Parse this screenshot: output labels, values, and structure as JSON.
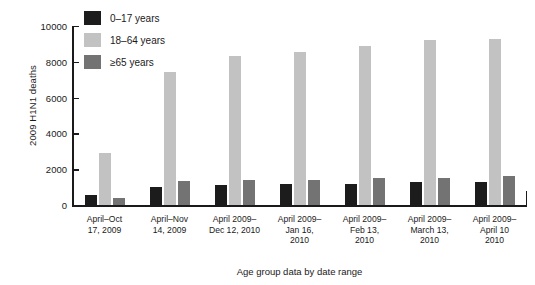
{
  "chart_data": {
    "type": "bar",
    "title": "",
    "xlabel": "Age group data by date range",
    "ylabel": "2009 H1N1 deaths",
    "ylim": [
      0,
      10000
    ],
    "yticks": [
      0,
      2000,
      4000,
      6000,
      8000,
      10000
    ],
    "ytick_labels": [
      "0",
      "2000",
      "4000",
      "6000",
      "8000",
      "10000"
    ],
    "grid": false,
    "legend_position": "top-left-inside",
    "categories": [
      "April–Oct\n17, 2009",
      "April–Nov\n14, 2009",
      "April 2009–\nDec 12, 2010",
      "April 2009–\nJan 16,\n2010",
      "April 2009–\nFeb 13,\n2010",
      "April 2009–\nMarch 13,\n2010",
      "April 2009–\nApril 10\n2010"
    ],
    "series": [
      {
        "name": "0–17 years",
        "color": "#1c1c1c",
        "values": [
          540,
          1020,
          1130,
          1180,
          1190,
          1280,
          1300
        ]
      },
      {
        "name": "18–64 years",
        "color": "#c2c2c2",
        "values": [
          2900,
          7430,
          8340,
          8570,
          8900,
          9200,
          9260
        ]
      },
      {
        "name": "≥65 years",
        "color": "#737373",
        "values": [
          400,
          1320,
          1380,
          1400,
          1500,
          1530,
          1620
        ]
      }
    ]
  },
  "legend": {
    "items": [
      {
        "label": "0–17 years",
        "color": "#1c1c1c"
      },
      {
        "label": "18–64 years",
        "color": "#c2c2c2"
      },
      {
        "label": "≥65 years",
        "color": "#737373"
      }
    ]
  },
  "axes": {
    "y_title": "2009 H1N1 deaths",
    "x_title": "Age group data by date range"
  }
}
